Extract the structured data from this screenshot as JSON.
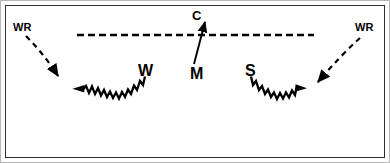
{
  "diagram": {
    "background_color": "#ffffff",
    "ink_color": "#000000",
    "outer_border_color": "#b8b8b8",
    "inner_border_color": "#2e2e2e",
    "line_of_scrimmage": {
      "style": "dashed",
      "x_start": 77,
      "x_end": 314,
      "y": 35
    },
    "labels": {
      "wr_left": "WR",
      "wr_right": "WR",
      "coverage": "C",
      "motion": "M",
      "w_route": "W",
      "s_route": "S"
    },
    "routes": [
      {
        "name": "wr-left-release",
        "label": "WR",
        "style": "dashed",
        "arrowhead": "end",
        "from": [
          26,
          36
        ],
        "to": [
          66,
          86
        ]
      },
      {
        "name": "w-route",
        "label": "W",
        "style": "zigzag",
        "arrowhead": "start",
        "from": [
          145,
          74
        ],
        "to": [
          74,
          88
        ]
      },
      {
        "name": "wr-right-release",
        "label": "WR",
        "style": "dashed",
        "arrowhead": "end",
        "from": [
          360,
          38
        ],
        "to": [
          310,
          87
        ]
      },
      {
        "name": "s-route",
        "label": "S",
        "style": "zigzag",
        "arrowhead": "end",
        "from": [
          251,
          74
        ],
        "to": [
          304,
          88
        ]
      },
      {
        "name": "motion-arrow",
        "label": "M",
        "style": "solid",
        "arrowhead": "end",
        "from": [
          194,
          64
        ],
        "to": [
          206,
          17
        ]
      }
    ]
  }
}
